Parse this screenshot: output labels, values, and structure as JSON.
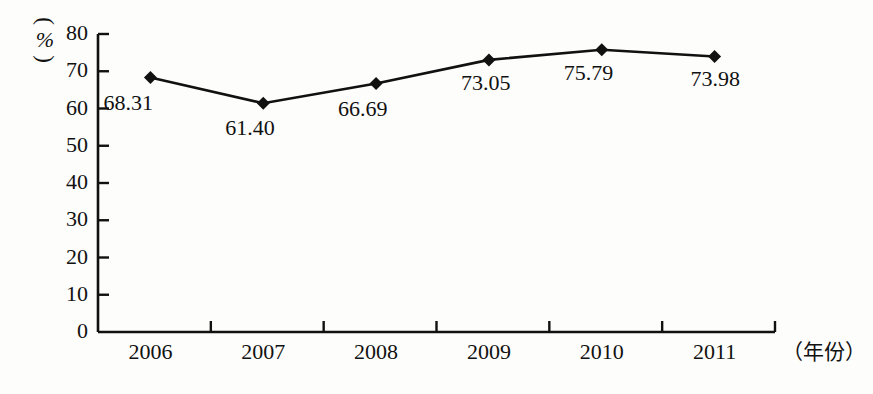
{
  "chart_data": {
    "type": "line",
    "title": "",
    "subtitle": "",
    "xlabel": "（年份）",
    "ylabel": "（%）",
    "categories": [
      "2006",
      "2007",
      "2008",
      "2009",
      "2010",
      "2011"
    ],
    "values": [
      68.31,
      61.4,
      66.69,
      73.05,
      75.79,
      73.98
    ],
    "point_labels": [
      "68.31",
      "61.40",
      "66.69",
      "73.05",
      "75.79",
      "73.98"
    ],
    "series": [
      {
        "name": "",
        "values": [
          68.31,
          61.4,
          66.69,
          73.05,
          75.79,
          73.98
        ]
      }
    ],
    "ylim": [
      0,
      80
    ],
    "y_ticks": [
      "0",
      "10",
      "20",
      "30",
      "40",
      "50",
      "60",
      "70",
      "80"
    ],
    "y_tick_values": [
      0,
      10,
      20,
      30,
      40,
      50,
      60,
      70,
      80
    ],
    "grid": false,
    "legend": false,
    "legend_position": "none",
    "marker": "diamond",
    "line_color": "#111111",
    "marker_color": "#111111",
    "background_color": "#fdfdfb",
    "axis_color": "#111111"
  },
  "y_axis": {
    "unit_paren_open": "︵",
    "unit_symbol": "%",
    "unit_paren_close": "︶"
  },
  "x_axis": {
    "unit": "（年份）"
  }
}
